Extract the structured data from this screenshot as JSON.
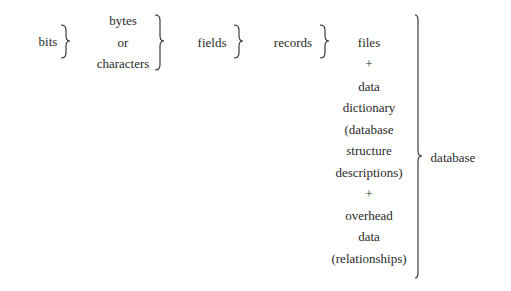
{
  "diagram": {
    "levels": [
      {
        "id": "bits",
        "lines": [
          "bits"
        ]
      },
      {
        "id": "bytes",
        "lines": [
          "bytes",
          "or",
          "characters"
        ]
      },
      {
        "id": "fields",
        "lines": [
          "fields"
        ]
      },
      {
        "id": "records",
        "lines": [
          "records"
        ]
      },
      {
        "id": "files",
        "lines": [
          "files",
          "+",
          "data",
          "dictionary",
          "(database",
          "structure",
          "descriptions)",
          "+",
          "overhead",
          "data",
          "(relationships)"
        ]
      },
      {
        "id": "database",
        "lines": [
          "database"
        ]
      }
    ],
    "connector": "brace",
    "ink_color": "#2a2a2a",
    "background_color": "#ffffff"
  }
}
